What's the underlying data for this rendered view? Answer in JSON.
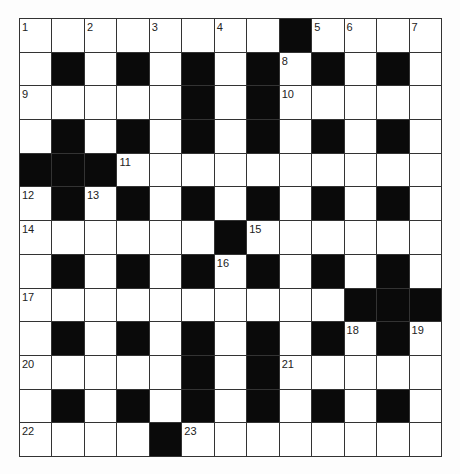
{
  "puzzle": {
    "rows": 13,
    "cols": 13,
    "grid": [
      "........#....",
      ".#.#.#.#.#.#.",
      ".....#.#.....",
      ".#.#.#.#.#.#.",
      "###..........",
      ".#.#.#.#.#.#.",
      "......#......",
      ".#.#.#.#.#.#.",
      "..........###",
      ".#.#.#.#.#.#.",
      ".....#.#.....",
      ".#.#.#.#.#.#.",
      "....#........"
    ],
    "numbers": [
      {
        "n": "1",
        "r": 0,
        "c": 0
      },
      {
        "n": "2",
        "r": 0,
        "c": 2
      },
      {
        "n": "3",
        "r": 0,
        "c": 4
      },
      {
        "n": "4",
        "r": 0,
        "c": 6
      },
      {
        "n": "5",
        "r": 0,
        "c": 9
      },
      {
        "n": "6",
        "r": 0,
        "c": 10
      },
      {
        "n": "7",
        "r": 0,
        "c": 12
      },
      {
        "n": "8",
        "r": 1,
        "c": 8
      },
      {
        "n": "9",
        "r": 2,
        "c": 0
      },
      {
        "n": "10",
        "r": 2,
        "c": 8
      },
      {
        "n": "11",
        "r": 4,
        "c": 3
      },
      {
        "n": "12",
        "r": 5,
        "c": 0
      },
      {
        "n": "13",
        "r": 5,
        "c": 2
      },
      {
        "n": "14",
        "r": 6,
        "c": 0
      },
      {
        "n": "15",
        "r": 6,
        "c": 7
      },
      {
        "n": "16",
        "r": 7,
        "c": 6
      },
      {
        "n": "17",
        "r": 8,
        "c": 0
      },
      {
        "n": "18",
        "r": 9,
        "c": 10
      },
      {
        "n": "19",
        "r": 9,
        "c": 12
      },
      {
        "n": "20",
        "r": 10,
        "c": 0
      },
      {
        "n": "21",
        "r": 10,
        "c": 8
      },
      {
        "n": "22",
        "r": 12,
        "c": 0
      },
      {
        "n": "23",
        "r": 12,
        "c": 5
      }
    ]
  },
  "colors": {
    "block": "#0a0a0a",
    "cell": "#ffffff",
    "line": "#333333"
  }
}
